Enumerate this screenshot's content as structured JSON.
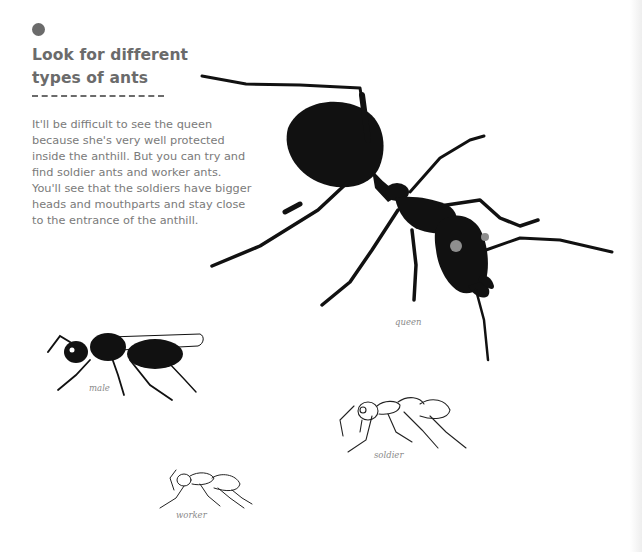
{
  "section": {
    "title_line1": "Look for different",
    "title_line2": "types of ants",
    "paragraph": "It'll be difficult to see the queen because she's very well protected inside the anthill. But you can try and find soldier ants and worker ants. You'll see that the soldiers have bigger heads and mouthparts and stay close to the entrance of the anthill."
  },
  "illustrations": {
    "queen": {
      "caption": "queen"
    },
    "male": {
      "caption": "male"
    },
    "soldier": {
      "caption": "soldier"
    },
    "worker": {
      "caption": "worker"
    }
  },
  "colors": {
    "heading": "#6b6b6b",
    "body_text": "#7a7a7a",
    "silhouette": "#111111",
    "eye_dot": "#8e8e8e"
  }
}
